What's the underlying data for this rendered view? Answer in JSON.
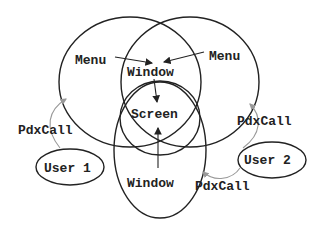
{
  "diagram": {
    "labels": {
      "menu_left": "Menu",
      "menu_right": "Menu",
      "window_top": "Window",
      "screen": "Screen",
      "window_bottom": "Window",
      "pdxcall_left": "PdxCall",
      "pdxcall_right": "PdxCall",
      "pdxcall_bottom": "PdxCall",
      "user1": "User 1",
      "user2": "User 2"
    },
    "colors": {
      "stroke": "#222222",
      "connector": "#999999",
      "background": "#ffffff"
    }
  }
}
